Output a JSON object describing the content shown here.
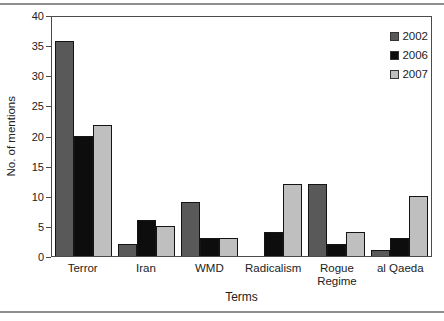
{
  "figure": {
    "rule_color": "#8e8e8e",
    "plot_border_color": "#4a4a4a",
    "background": "#ffffff"
  },
  "chart_data": {
    "type": "bar",
    "title": "",
    "categories": [
      "Terror",
      "Iran",
      "WMD",
      "Radicalism",
      "Rogue Regime",
      "al Qaeda"
    ],
    "series": [
      {
        "name": "2002",
        "color": "#595959",
        "values": [
          36,
          2,
          9,
          0,
          12,
          1
        ]
      },
      {
        "name": "2006",
        "color": "#0d0d0d",
        "values": [
          20,
          6,
          3,
          4,
          2,
          3
        ]
      },
      {
        "name": "2007",
        "color": "#bfbfbf",
        "values": [
          22,
          5,
          3,
          12,
          4,
          10
        ]
      }
    ],
    "xlabel": "Terms",
    "ylabel": "No. of mentions",
    "ylim": [
      0,
      40
    ],
    "yticks": [
      0,
      5,
      10,
      15,
      20,
      25,
      30,
      35,
      40
    ],
    "grid": false,
    "legend_position": "top-right"
  }
}
